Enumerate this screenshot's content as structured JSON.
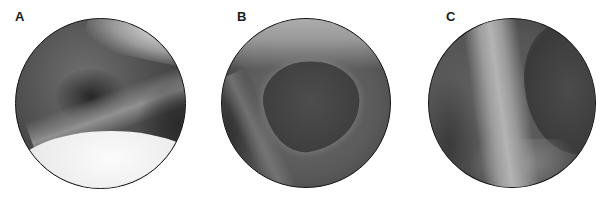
{
  "figure": {
    "panels": [
      {
        "label": "A",
        "view": "circular arthroscopic view with bright rounded structure at bottom and dark recess above"
      },
      {
        "label": "B",
        "view": "circular arthroscopic view with a dark rounded opening outlined by lighter tissue"
      },
      {
        "label": "C",
        "view": "circular arthroscopic view with a bright vertical band (tendon) crossing the field"
      }
    ]
  }
}
